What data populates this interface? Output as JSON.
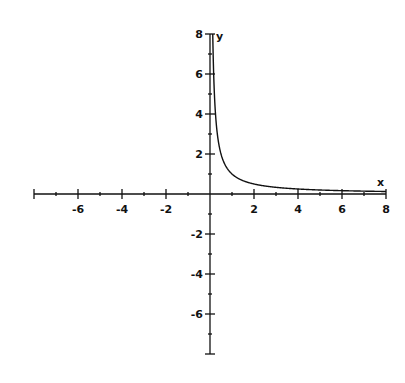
{
  "chart_data": {
    "type": "line",
    "title": "",
    "xlabel": "x",
    "ylabel": "y",
    "xlim": [
      -8,
      8
    ],
    "ylim": [
      -8,
      8
    ],
    "grid": false,
    "legend": null,
    "x_ticks_labeled": [
      -6,
      -4,
      -2,
      2,
      4,
      6,
      8
    ],
    "x_tick_labels": [
      "-6",
      "-4",
      "-2",
      "2",
      "4",
      "6",
      "8"
    ],
    "y_ticks_labeled": [
      8,
      6,
      4,
      2,
      -2,
      -4,
      -6
    ],
    "y_tick_labels": [
      "8",
      "6",
      "4",
      "2",
      "-2",
      "-4",
      "-6"
    ],
    "minor_tick_step": 1,
    "series": [
      {
        "name": "y = 1/x (x > 0)",
        "x": [
          0.125,
          0.15,
          0.2,
          0.25,
          0.3,
          0.4,
          0.5,
          0.75,
          1,
          1.5,
          2,
          3,
          4,
          5,
          6,
          7,
          8
        ],
        "values": [
          8,
          6.67,
          5,
          4,
          3.33,
          2.5,
          2,
          1.33,
          1,
          0.67,
          0.5,
          0.33,
          0.25,
          0.2,
          0.17,
          0.14,
          0.125
        ]
      }
    ]
  },
  "axes": {
    "x_label": "x",
    "y_label": "y"
  }
}
